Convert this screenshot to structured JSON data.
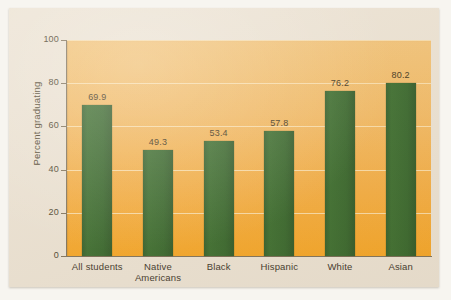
{
  "figure": {
    "background_color": "#ece2d2",
    "plot_background_top": "#f2c173",
    "plot_background_bottom": "#f6a421",
    "bar_color": "#33622663",
    "gridline_color": "#fbe3b4",
    "axis_color": "#7d6f56"
  },
  "chart_data": {
    "type": "bar",
    "title": "",
    "subtitle": "",
    "xlabel": "",
    "ylabel": "Percent graduating",
    "categories": [
      "All students",
      "Native Americans",
      "Black",
      "Hispanic",
      "White",
      "Asian"
    ],
    "category_lines": [
      [
        "All students"
      ],
      [
        "Native",
        "Americans"
      ],
      [
        "Black"
      ],
      [
        "Hispanic"
      ],
      [
        "White"
      ],
      [
        "Asian"
      ]
    ],
    "values": [
      69.9,
      49.3,
      53.4,
      57.8,
      76.2,
      80.2
    ],
    "value_labels": [
      "69.9",
      "49.3",
      "53.4",
      "57.8",
      "76.2",
      "80.2"
    ],
    "ylim": [
      0,
      100
    ],
    "yticks": [
      0,
      20,
      40,
      60,
      80,
      100
    ],
    "ytick_labels": [
      "0",
      "20",
      "40",
      "60",
      "80",
      "100"
    ],
    "xlim_note": "categorical",
    "grid": "horizontal",
    "legend": "none",
    "bar_color": "#336326",
    "series": [
      {
        "name": "Percent graduating",
        "values": [
          69.9,
          49.3,
          53.4,
          57.8,
          76.2,
          80.2
        ]
      }
    ]
  }
}
